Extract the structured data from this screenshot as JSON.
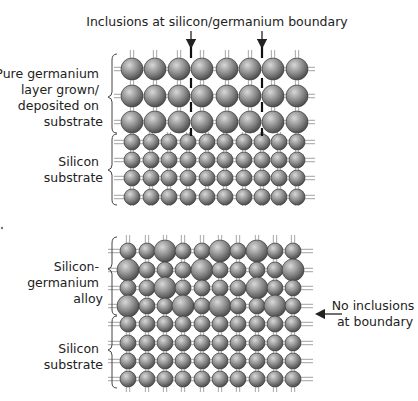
{
  "top_panel": {
    "title": "Inclusions at silicon/germanium boundary",
    "labels": {
      "germanium_layer": [
        "Pure germanium",
        "layer grown/",
        "deposited on",
        "substrate"
      ],
      "silicon_substrate": [
        "Silicon",
        "substrate"
      ]
    },
    "germanium_rows": 3,
    "germanium_columns": 8,
    "silicon_rows": 4,
    "silicon_columns": 10,
    "inclusion_markers_x": [
      191,
      262
    ]
  },
  "bottom_panel": {
    "labels": {
      "alloy": [
        "Silicon-",
        "germanium",
        "alloy"
      ],
      "silicon_substrate": [
        "Silicon",
        "substrate"
      ],
      "annotation": [
        "No inclusions",
        "at boundary"
      ]
    },
    "alloy_rows_pattern": [
      [
        "S",
        "S",
        "L",
        "S",
        "S",
        "L",
        "S",
        "L",
        "S",
        "S"
      ],
      [
        "L",
        "S",
        "S",
        "S",
        "L",
        "S",
        "S",
        "S",
        "S",
        "L"
      ],
      [
        "S",
        "S",
        "L",
        "S",
        "S",
        "S",
        "S",
        "L",
        "S",
        "S"
      ],
      [
        "L",
        "S",
        "S",
        "L",
        "S",
        "L",
        "S",
        "S",
        "L",
        "S"
      ]
    ],
    "silicon_rows": 4,
    "columns": 10
  },
  "colors": {
    "atom_light": "#d8d8d8",
    "atom_mid": "#8c8c8c",
    "atom_dark": "#4a4a4a",
    "bond": "#b5b5b5",
    "text": "#222222"
  },
  "legend": {
    "large_atom": "germanium",
    "small_atom": "silicon"
  }
}
